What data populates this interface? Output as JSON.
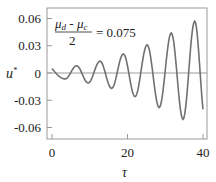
{
  "chart_data": {
    "type": "line",
    "title": "",
    "xlabel": "τ",
    "ylabel": "u*",
    "xlim": [
      -1.3,
      41.3
    ],
    "ylim": [
      -0.072,
      0.072
    ],
    "xticks": [
      0,
      20,
      40
    ],
    "xtick_labels": [
      "0",
      "20",
      "40"
    ],
    "yticks": [
      0.06,
      0.03,
      0,
      -0.03,
      -0.06
    ],
    "ytick_labels": [
      "0.06",
      "0.03",
      "0",
      "-0.03",
      "-0.06"
    ],
    "grid": false,
    "zero_line": true,
    "annotation": {
      "numerator_left": "μ",
      "numerator_left_sub": "d",
      "minus": " - ",
      "numerator_right": "μ",
      "numerator_right_sub": "c",
      "denominator": "2",
      "equals_value": "= 0.075",
      "placement": "top-left"
    },
    "series": [
      {
        "name": "u*",
        "color": "#707070",
        "extrema": [
          {
            "x": 0,
            "y": 0.005
          },
          {
            "x": 3.5,
            "y": -0.0065
          },
          {
            "x": 6.5,
            "y": 0.008
          },
          {
            "x": 9.6,
            "y": -0.011
          },
          {
            "x": 12.7,
            "y": 0.013
          },
          {
            "x": 15.8,
            "y": -0.017
          },
          {
            "x": 18.9,
            "y": 0.021
          },
          {
            "x": 22.0,
            "y": -0.026
          },
          {
            "x": 25.2,
            "y": 0.031
          },
          {
            "x": 28.4,
            "y": -0.038
          },
          {
            "x": 31.6,
            "y": 0.044
          },
          {
            "x": 34.7,
            "y": -0.051
          },
          {
            "x": 37.8,
            "y": 0.057
          },
          {
            "x": 40,
            "y": -0.04
          }
        ]
      }
    ]
  }
}
